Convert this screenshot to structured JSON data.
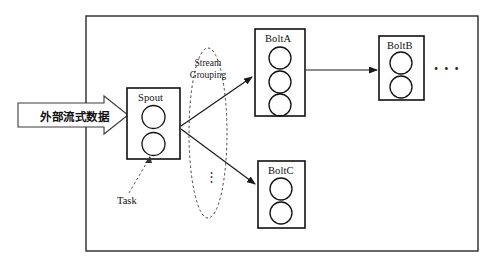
{
  "diagram": {
    "background_color": "#ffffff",
    "stroke_color": "#1a1a1a",
    "outer_frame": {
      "name": "topology-frame",
      "x": 86,
      "y": 16,
      "w": 392,
      "h": 235
    },
    "input_banner": {
      "label": "外部流式数据",
      "name": "external-stream-data-arrow"
    },
    "nodes": [
      {
        "id": "spout",
        "label": "Spout",
        "task_count": 2,
        "x": 127,
        "y": 88,
        "w": 53,
        "h": 71
      },
      {
        "id": "bolt-a",
        "label": "BoltA",
        "task_count": 3,
        "x": 255,
        "y": 29,
        "w": 50,
        "h": 87
      },
      {
        "id": "bolt-b",
        "label": "BoltB",
        "task_count": 2,
        "x": 379,
        "y": 36,
        "w": 45,
        "h": 64
      },
      {
        "id": "bolt-c",
        "label": "BoltC",
        "task_count": 2,
        "x": 258,
        "y": 161,
        "w": 47,
        "h": 67
      }
    ],
    "grouping_ellipse": {
      "label_line1": "Stream",
      "label_line2": "Grouping",
      "vertical_ellipsis": "⋮",
      "cx": 208,
      "cy": 133,
      "rx": 19,
      "ry": 85
    },
    "task_callout": {
      "label": "Task"
    },
    "more_bolts_ellipsis": "• • •",
    "edges": [
      {
        "from": "spout",
        "to": "bolt-a",
        "style": "solid-arrow"
      },
      {
        "from": "spout",
        "to": "bolt-c",
        "style": "solid-arrow"
      },
      {
        "from": "bolt-a",
        "to": "bolt-b",
        "style": "solid-arrow"
      },
      {
        "from": "task-label",
        "to": "spout-task-2",
        "style": "dashed-leader"
      }
    ]
  }
}
